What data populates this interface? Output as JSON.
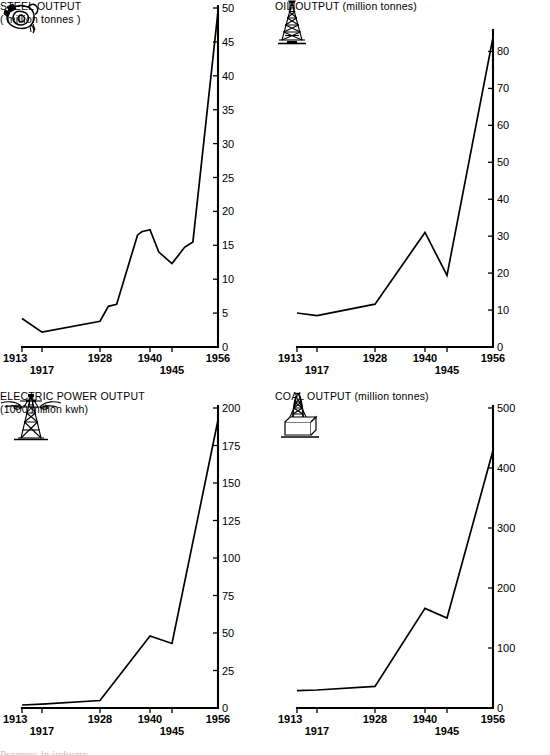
{
  "page": {
    "background_color": "#ffffff",
    "ink_color": "#000000",
    "layout": "2x2 grid of line charts"
  },
  "charts": [
    {
      "id": "steel",
      "icon_name": "steel-ladle-icon",
      "title": "STEEL OUTPUT",
      "subtitle": "( million tonnes )",
      "title_layout": "stacked",
      "chart_data": {
        "type": "line",
        "title": "STEEL OUTPUT",
        "subtitle": "( million tonnes )",
        "xlabel": "",
        "ylabel": "million tonnes",
        "grid": false,
        "legend": "none",
        "xlim": [
          1913,
          1956
        ],
        "ylim": [
          0,
          50
        ],
        "yticks": [
          0,
          5,
          10,
          15,
          20,
          25,
          30,
          35,
          40,
          45,
          50
        ],
        "xticks": [
          1913,
          1917,
          1928,
          1940,
          1945,
          1956
        ],
        "x": [
          1913,
          1917,
          1928,
          1930,
          1932,
          1937,
          1938,
          1940,
          1942,
          1945,
          1948,
          1950,
          1956
        ],
        "values": [
          4.2,
          2.2,
          3.8,
          6.0,
          6.3,
          16.5,
          17.0,
          17.3,
          14.0,
          12.3,
          14.7,
          15.5,
          49.5
        ]
      }
    },
    {
      "id": "oil",
      "icon_name": "oil-derrick-icon",
      "title": "OIL OUTPUT",
      "subtitle": "(million tonnes)",
      "title_layout": "inline",
      "chart_data": {
        "type": "line",
        "title": "OIL OUTPUT",
        "subtitle": "(million tonnes)",
        "xlabel": "",
        "ylabel": "million tonnes",
        "grid": false,
        "legend": "none",
        "xlim": [
          1913,
          1956
        ],
        "ylim": [
          0,
          85
        ],
        "yticks": [
          0,
          10,
          20,
          30,
          40,
          50,
          60,
          70,
          80
        ],
        "xticks": [
          1913,
          1917,
          1928,
          1940,
          1945,
          1956
        ],
        "x": [
          1913,
          1917,
          1928,
          1940,
          1945,
          1956
        ],
        "values": [
          9.2,
          8.5,
          11.6,
          31.0,
          19.4,
          83.8
        ]
      }
    },
    {
      "id": "electric",
      "icon_name": "electric-pylon-icon",
      "title": "ELECTRIC POWER OUTPUT",
      "subtitle": "(1000 million kwh)",
      "title_layout": "stacked",
      "chart_data": {
        "type": "line",
        "title": "ELECTRIC POWER OUTPUT",
        "subtitle": "(1000 million kwh)",
        "xlabel": "",
        "ylabel": "1000 million kwh",
        "grid": false,
        "legend": "none",
        "xlim": [
          1913,
          1956
        ],
        "ylim": [
          0,
          200
        ],
        "yticks": [
          0,
          25,
          50,
          75,
          100,
          125,
          150,
          175,
          200
        ],
        "xticks": [
          1913,
          1917,
          1928,
          1940,
          1945,
          1956
        ],
        "x": [
          1913,
          1917,
          1928,
          1940,
          1945,
          1956
        ],
        "values": [
          2.0,
          2.6,
          5.0,
          48.0,
          43.0,
          192.0
        ]
      }
    },
    {
      "id": "coal",
      "icon_name": "coal-headframe-icon",
      "title": "COAL OUTPUT",
      "subtitle": "(million tonnes)",
      "title_layout": "inline",
      "chart_data": {
        "type": "line",
        "title": "COAL OUTPUT",
        "subtitle": "(million tonnes)",
        "xlabel": "",
        "ylabel": "million tonnes",
        "grid": false,
        "legend": "none",
        "xlim": [
          1913,
          1956
        ],
        "ylim": [
          0,
          500
        ],
        "yticks": [
          0,
          100,
          200,
          300,
          400,
          500
        ],
        "xticks": [
          1913,
          1917,
          1928,
          1940,
          1945,
          1956
        ],
        "x": [
          1913,
          1917,
          1928,
          1940,
          1945,
          1956
        ],
        "values": [
          29.0,
          30.0,
          36.0,
          166.0,
          150.0,
          429.0
        ]
      }
    }
  ],
  "footer": {
    "cut_off_text": "Progress in industry"
  }
}
